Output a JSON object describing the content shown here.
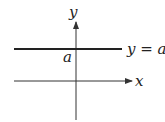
{
  "diagram": {
    "axes": {
      "x_label": "x",
      "y_label": "y"
    },
    "line": {
      "equation_label": "y = a",
      "intercept_label": "a"
    },
    "colors": {
      "axis": "#333333",
      "line": "#222222",
      "background": "#ffffff"
    }
  }
}
